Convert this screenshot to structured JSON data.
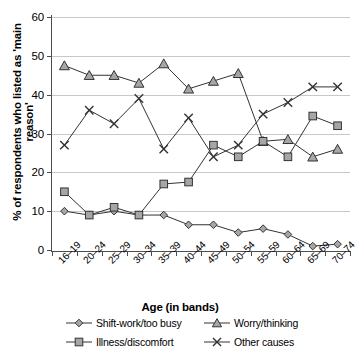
{
  "chart_data": {
    "type": "line",
    "title": "",
    "xlabel": "Age (in bands)",
    "ylabel": "% of respondents who listed as 'main reason'",
    "categories": [
      "16–19",
      "20–24",
      "25–29",
      "30–34",
      "35–39",
      "40–44",
      "45–49",
      "50–54",
      "55–59",
      "60–64",
      "65–69",
      "70–74"
    ],
    "ylim": [
      0,
      60
    ],
    "yticks": [
      0,
      10,
      20,
      30,
      40,
      50,
      60
    ],
    "grid": true,
    "legend_position": "bottom",
    "series": [
      {
        "name": "Shift-work/too busy",
        "marker": "diamond",
        "values": [
          10,
          9,
          10,
          9,
          9,
          6.5,
          6.5,
          4.5,
          5.5,
          4,
          1,
          1.5
        ]
      },
      {
        "name": "Worry/thinking",
        "marker": "triangle",
        "values": [
          47.5,
          45,
          45,
          43,
          48,
          41.5,
          43.5,
          45.5,
          28,
          28.5,
          24,
          26
        ]
      },
      {
        "name": "Illness/discomfort",
        "marker": "square",
        "values": [
          15,
          9,
          11,
          9,
          17,
          17.5,
          27,
          24,
          28,
          24,
          34.5,
          32
        ]
      },
      {
        "name": "Other causes",
        "marker": "cross",
        "values": [
          27,
          36,
          32.5,
          39,
          26,
          34,
          24,
          27,
          35,
          38,
          42,
          42
        ]
      }
    ]
  },
  "legend": {
    "items": [
      {
        "label": "Shift-work/too busy",
        "marker": "diamond"
      },
      {
        "label": "Worry/thinking",
        "marker": "triangle"
      },
      {
        "label": "Illness/discomfort",
        "marker": "square"
      },
      {
        "label": "Other causes",
        "marker": "cross"
      }
    ]
  },
  "colors": {
    "marker_fill": "#a6a6a6",
    "line": "#333333",
    "grid": "#c8c8c8",
    "axis": "#4d4d4d",
    "text": "#000000"
  }
}
